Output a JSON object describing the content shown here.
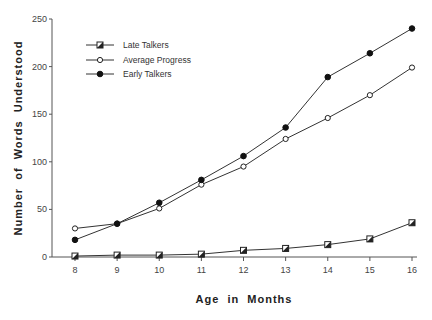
{
  "chart_data": {
    "type": "line",
    "title": "",
    "xlabel": "Age in Months",
    "ylabel": "Number of Words Understood",
    "x": [
      8,
      9,
      10,
      11,
      12,
      13,
      14,
      15,
      16
    ],
    "xlim": [
      8,
      16
    ],
    "ylim": [
      0,
      250
    ],
    "yticks": [
      0,
      50,
      100,
      150,
      200,
      250
    ],
    "xticks": [
      8,
      9,
      10,
      11,
      12,
      13,
      14,
      15,
      16
    ],
    "grid": false,
    "legend_position": "upper-left",
    "series": [
      {
        "name": "Late Talkers",
        "marker": "half-filled-square",
        "values": [
          1,
          2,
          2,
          3,
          7,
          9,
          13,
          19,
          36
        ]
      },
      {
        "name": "Average Progress",
        "marker": "open-circle",
        "values": [
          30,
          35,
          51,
          76,
          95,
          124,
          146,
          170,
          199
        ]
      },
      {
        "name": "Early Talkers",
        "marker": "filled-circle",
        "values": [
          18,
          35,
          57,
          81,
          106,
          136,
          189,
          214,
          240
        ]
      }
    ]
  },
  "labels": {
    "xlabel": "Age in Months",
    "ylabel": "Number of Words Understood",
    "legend": [
      "Late Talkers",
      "Average Progress",
      "Early Talkers"
    ]
  }
}
